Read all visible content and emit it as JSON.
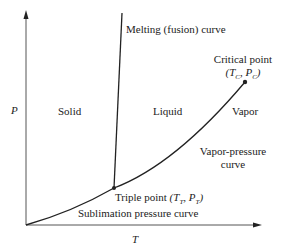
{
  "diagram": {
    "axes": {
      "y_label": "P",
      "x_label": "T"
    },
    "regions": {
      "solid": "Solid",
      "liquid": "Liquid",
      "vapor": "Vapor"
    },
    "curves": {
      "melting": "Melting (fusion) curve",
      "vapor_pressure_line1": "Vapor-pressure",
      "vapor_pressure_line2": "curve",
      "sublimation": "Sublimation pressure curve"
    },
    "points": {
      "critical_label": "Critical point",
      "critical_coords": "(T C, P C)",
      "triple_label": "Triple point",
      "triple_coords": "(T T, P T)"
    },
    "colors": {
      "line": "#222222",
      "axis": "#555555",
      "text": "#222222"
    }
  }
}
